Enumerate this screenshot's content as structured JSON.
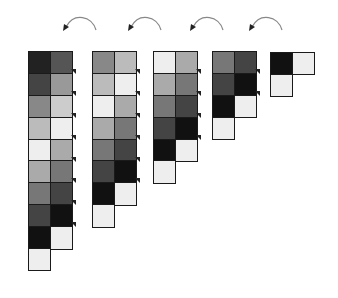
{
  "diagram": {
    "arrows": [
      {
        "id": "arrow-1",
        "x": 60,
        "y": 14
      },
      {
        "id": "arrow-2",
        "x": 125,
        "y": 14
      },
      {
        "id": "arrow-3",
        "x": 187,
        "y": 14
      },
      {
        "id": "arrow-4",
        "x": 246,
        "y": 14
      }
    ],
    "groups": [
      {
        "id": "group-1",
        "x": 28,
        "y": 51,
        "left": [
          "#222222",
          "#444444",
          "#888888",
          "#bbbbbb",
          "#eeeeee",
          "#aaaaaa",
          "#777777",
          "#444444",
          "#111111",
          "#eeeeee"
        ],
        "right": [
          "#555555",
          "#999999",
          "#cccccc",
          "#eeeeee",
          "#aaaaaa",
          "#777777",
          "#444444",
          "#111111",
          "#eeeeee"
        ]
      },
      {
        "id": "group-2",
        "x": 92,
        "y": 51,
        "left": [
          "#888888",
          "#bbbbbb",
          "#eeeeee",
          "#aaaaaa",
          "#777777",
          "#444444",
          "#111111",
          "#eeeeee"
        ],
        "right": [
          "#bbbbbb",
          "#eeeeee",
          "#aaaaaa",
          "#777777",
          "#444444",
          "#111111",
          "#eeeeee"
        ]
      },
      {
        "id": "group-3",
        "x": 153,
        "y": 51,
        "left": [
          "#eeeeee",
          "#aaaaaa",
          "#777777",
          "#444444",
          "#111111",
          "#eeeeee"
        ],
        "right": [
          "#aaaaaa",
          "#777777",
          "#444444",
          "#111111",
          "#eeeeee"
        ]
      },
      {
        "id": "group-4",
        "x": 212,
        "y": 51,
        "left": [
          "#777777",
          "#444444",
          "#111111",
          "#eeeeee"
        ],
        "right": [
          "#444444",
          "#111111",
          "#eeeeee"
        ]
      },
      {
        "id": "group-5",
        "x": 270,
        "y": 52,
        "left": [
          "#111111",
          "#eeeeee"
        ],
        "right": [
          "#eeeeee"
        ]
      }
    ],
    "colors": {
      "border": "#1a1a1a",
      "arrow": "#888888",
      "arrowhead": "#222222",
      "background": "#ffffff"
    }
  }
}
